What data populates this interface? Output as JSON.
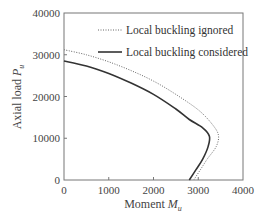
{
  "chart_data": {
    "type": "line",
    "title": "",
    "xlabel": "Moment M_u",
    "xlabel_main": "Moment ",
    "xlabel_italic": "M",
    "xlabel_sub": "u",
    "ylabel": "Axial load P_u",
    "ylabel_main": "Axial load ",
    "ylabel_italic": "P",
    "ylabel_sub": "u",
    "xlim": [
      0,
      4000
    ],
    "ylim": [
      0,
      40000
    ],
    "xticks": [
      "0",
      "1000",
      "2000",
      "3000",
      "4000"
    ],
    "yticks": [
      "0",
      "10000",
      "20000",
      "30000",
      "40000"
    ],
    "grid": false,
    "legend_position": "upper right (inside)",
    "series": [
      {
        "name": "Local buckling ignored",
        "style": "dotted",
        "color": "#666666",
        "points": [
          [
            0,
            31200
          ],
          [
            500,
            30000
          ],
          [
            1000,
            28300
          ],
          [
            1500,
            26200
          ],
          [
            2000,
            23700
          ],
          [
            2500,
            20500
          ],
          [
            3000,
            16800
          ],
          [
            3300,
            13500
          ],
          [
            3450,
            10800
          ],
          [
            3400,
            8000
          ],
          [
            3200,
            5000
          ],
          [
            3050,
            2500
          ],
          [
            2900,
            0
          ]
        ]
      },
      {
        "name": "Local buckling considered",
        "style": "solid",
        "color": "#333333",
        "points": [
          [
            0,
            28500
          ],
          [
            500,
            27300
          ],
          [
            1000,
            25500
          ],
          [
            1500,
            23200
          ],
          [
            2000,
            20500
          ],
          [
            2500,
            17000
          ],
          [
            2800,
            14500
          ],
          [
            3100,
            12500
          ],
          [
            3250,
            10500
          ],
          [
            3220,
            8000
          ],
          [
            3100,
            5000
          ],
          [
            2950,
            2500
          ],
          [
            2800,
            0
          ]
        ]
      }
    ]
  },
  "legend": {
    "items": [
      {
        "label": "Local buckling ignored"
      },
      {
        "label": "Local buckling considered"
      }
    ]
  }
}
